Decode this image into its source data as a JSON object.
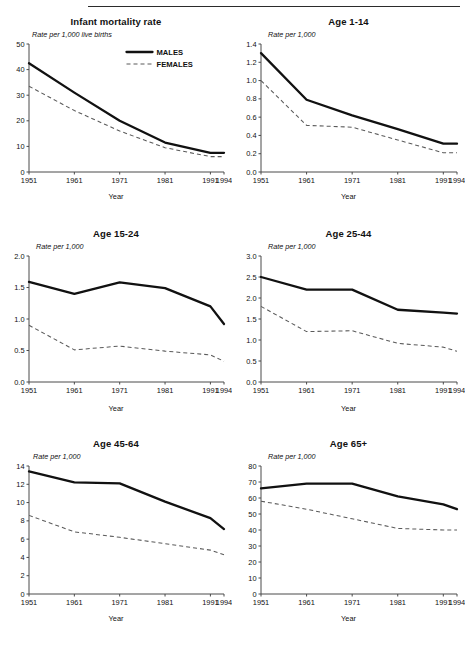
{
  "figure": {
    "legend": {
      "male_label": "MALES",
      "female_label": "FEMALES"
    },
    "x_axis_title": "Year",
    "x_ticks": [
      "1951",
      "1961",
      "1971",
      "1981",
      "1991",
      "1994"
    ]
  },
  "chart_data": [
    {
      "type": "line",
      "title": "Infant mortality rate",
      "ylabel": "Rate per 1,000 live births",
      "xlabel": "Year",
      "x": [
        1951,
        1961,
        1971,
        1981,
        1991,
        1994
      ],
      "x_ticklabels": [
        "1951",
        "1961",
        "1971",
        "1981",
        "1991",
        "1994"
      ],
      "y_ticks": [
        0,
        10,
        20,
        30,
        40,
        50
      ],
      "y_ticklabels": [
        "0",
        "10",
        "20",
        "30",
        "40",
        "50"
      ],
      "ylim": [
        0,
        50
      ],
      "grid": false,
      "legend_position": "top-right",
      "series": [
        {
          "name": "MALES",
          "style": "solid",
          "values": [
            42.5,
            31.0,
            20.0,
            11.5,
            7.5,
            7.5
          ]
        },
        {
          "name": "FEMALES",
          "style": "dashed",
          "values": [
            33.5,
            24.0,
            16.0,
            9.5,
            6.0,
            6.0
          ]
        }
      ]
    },
    {
      "type": "line",
      "title": "Age 1-14",
      "ylabel": "Rate per 1,000",
      "xlabel": "Year",
      "x": [
        1951,
        1961,
        1971,
        1981,
        1991,
        1994
      ],
      "x_ticklabels": [
        "1951",
        "1961",
        "1971",
        "1981",
        "1991",
        "1994"
      ],
      "y_ticks": [
        0.0,
        0.2,
        0.4,
        0.6,
        0.8,
        1.0,
        1.2,
        1.4
      ],
      "y_ticklabels": [
        "0.0",
        "0.2",
        "0.4",
        "0.6",
        "0.8",
        "1.0",
        "1.2",
        "1.4"
      ],
      "ylim": [
        0.0,
        1.4
      ],
      "grid": false,
      "legend_position": "none",
      "series": [
        {
          "name": "MALES",
          "style": "solid",
          "values": [
            1.3,
            0.79,
            0.62,
            0.47,
            0.31,
            0.31
          ]
        },
        {
          "name": "FEMALES",
          "style": "dashed",
          "values": [
            1.0,
            0.51,
            0.49,
            0.35,
            0.21,
            0.21
          ]
        }
      ]
    },
    {
      "type": "line",
      "title": "Age 15-24",
      "ylabel": "Rate per 1,000",
      "xlabel": "Year",
      "x": [
        1951,
        1961,
        1971,
        1981,
        1991,
        1994
      ],
      "x_ticklabels": [
        "1951",
        "1961",
        "1971",
        "1981",
        "1991",
        "1994"
      ],
      "y_ticks": [
        0.0,
        0.5,
        1.0,
        1.5,
        2.0
      ],
      "y_ticklabels": [
        "0.0",
        "0.5",
        "1.0",
        "1.5",
        "2.0"
      ],
      "ylim": [
        0.0,
        2.0
      ],
      "grid": false,
      "legend_position": "none",
      "series": [
        {
          "name": "MALES",
          "style": "solid",
          "values": [
            1.59,
            1.4,
            1.58,
            1.49,
            1.2,
            0.92
          ]
        },
        {
          "name": "FEMALES",
          "style": "dashed",
          "values": [
            0.9,
            0.51,
            0.57,
            0.49,
            0.43,
            0.33
          ]
        }
      ]
    },
    {
      "type": "line",
      "title": "Age 25-44",
      "ylabel": "Rate per 1,000",
      "xlabel": "Year",
      "x": [
        1951,
        1961,
        1971,
        1981,
        1991,
        1994
      ],
      "x_ticklabels": [
        "1951",
        "1961",
        "1971",
        "1981",
        "1991",
        "1994"
      ],
      "y_ticks": [
        0.0,
        0.5,
        1.0,
        1.5,
        2.0,
        2.5,
        3.0
      ],
      "y_ticklabels": [
        "0.0",
        "0.5",
        "1.0",
        "1.5",
        "2.0",
        "2.5",
        "3.0"
      ],
      "ylim": [
        0.0,
        3.0
      ],
      "grid": false,
      "legend_position": "none",
      "series": [
        {
          "name": "MALES",
          "style": "solid",
          "values": [
            2.5,
            2.2,
            2.2,
            1.72,
            1.65,
            1.63
          ]
        },
        {
          "name": "FEMALES",
          "style": "dashed",
          "values": [
            1.8,
            1.2,
            1.22,
            0.92,
            0.83,
            0.73
          ]
        }
      ]
    },
    {
      "type": "line",
      "title": "Age 45-64",
      "ylabel": "Rate per 1,000",
      "xlabel": "Year",
      "x": [
        1951,
        1961,
        1971,
        1981,
        1991,
        1994
      ],
      "x_ticklabels": [
        "1951",
        "1961",
        "1971",
        "1981",
        "1991",
        "1994"
      ],
      "y_ticks": [
        0,
        2,
        4,
        6,
        8,
        10,
        12,
        14
      ],
      "y_ticklabels": [
        "0",
        "2",
        "4",
        "6",
        "8",
        "10",
        "12",
        "14"
      ],
      "ylim": [
        0,
        14
      ],
      "grid": false,
      "legend_position": "none",
      "series": [
        {
          "name": "MALES",
          "style": "solid",
          "values": [
            13.4,
            12.2,
            12.1,
            10.1,
            8.3,
            7.1
          ]
        },
        {
          "name": "FEMALES",
          "style": "dashed",
          "values": [
            8.6,
            6.8,
            6.2,
            5.5,
            4.8,
            4.3
          ]
        }
      ]
    },
    {
      "type": "line",
      "title": "Age 65+",
      "ylabel": "Rate per 1,000",
      "xlabel": "Year",
      "x": [
        1951,
        1961,
        1971,
        1981,
        1991,
        1994
      ],
      "x_ticklabels": [
        "1951",
        "1961",
        "1971",
        "1981",
        "1991",
        "1994"
      ],
      "y_ticks": [
        0,
        10,
        20,
        30,
        40,
        50,
        60,
        70,
        80
      ],
      "y_ticklabels": [
        "0",
        "10",
        "20",
        "30",
        "40",
        "50",
        "60",
        "70",
        "80"
      ],
      "ylim": [
        0,
        80
      ],
      "grid": false,
      "legend_position": "none",
      "series": [
        {
          "name": "MALES",
          "style": "solid",
          "values": [
            66,
            69,
            69,
            61,
            56,
            53
          ]
        },
        {
          "name": "FEMALES",
          "style": "dashed",
          "values": [
            58,
            53,
            47,
            41,
            40,
            40
          ]
        }
      ]
    }
  ]
}
